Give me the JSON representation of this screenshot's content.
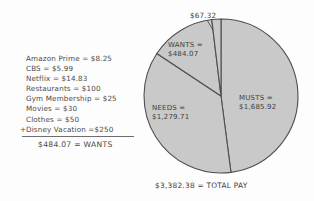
{
  "expenses": {
    "items": [
      {
        "label": "Amazon Prime = $8.25",
        "prefix": ""
      },
      {
        "label": "CBS = $5.99",
        "prefix": ""
      },
      {
        "label": "Netflix = $14.83",
        "prefix": ""
      },
      {
        "label": "Restaurants = $100",
        "prefix": ""
      },
      {
        "label": "Gym Membership = $25",
        "prefix": ""
      },
      {
        "label": "Movies = $30",
        "prefix": ""
      },
      {
        "label": "Clothes = $50",
        "prefix": ""
      },
      {
        "label": "Disney Vacation =$250",
        "prefix": "+"
      }
    ],
    "total_line": "$484.07 = WANTS"
  },
  "chart_labels": {
    "sliver": "$67.32",
    "wants_line1": "WANTS =",
    "wants_line2": "$484.07",
    "needs_line1": "NEEDS =",
    "needs_line2": "$1,279.71",
    "musts_line1": "MUSTS =",
    "musts_line2": "$1,685.92",
    "total_pay": "$3,382.38 = TOTAL PAY"
  },
  "colors": {
    "slice_fill": "#c9c9c9",
    "slice_stroke": "#4f4f4f",
    "ink": "#434343",
    "background": "#fdfdfd"
  },
  "chart_data": {
    "type": "pie",
    "title": "",
    "categories": [
      "MUSTS",
      "NEEDS",
      "WANTS",
      "Unlabeled sliver"
    ],
    "values": [
      1685.92,
      1279.71,
      484.07,
      67.32
    ],
    "value_labels": [
      "$1,685.92",
      "$1,279.71",
      "$484.07",
      "$67.32"
    ],
    "total": 3382.38,
    "total_label": "$3,382.38 = TOTAL PAY",
    "start_angle_deg": 0,
    "direction": "clockwise",
    "legend": "none",
    "grid": false,
    "annotations": [
      "Amazon Prime = $8.25",
      "CBS = $5.99",
      "Netflix = $14.83",
      "Restaurants = $100",
      "Gym Membership = $25",
      "Movies = $30",
      "Clothes = $50",
      "+ Disney Vacation =$250",
      "$484.07 = WANTS"
    ]
  }
}
